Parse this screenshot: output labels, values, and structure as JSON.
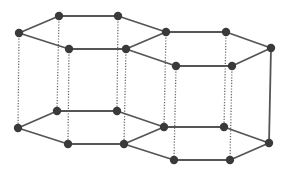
{
  "diagram": {
    "type": "crystal-lattice",
    "colors": {
      "background": "#ffffff",
      "atom": "#3a3a3a",
      "bond": "#555555",
      "vertical_dotted": "#6a6a6a"
    },
    "atom_radius": 4.2,
    "nodes": {
      "tL0": [
        19,
        33
      ],
      "tL1": [
        59,
        16
      ],
      "tL2": [
        118,
        16
      ],
      "tL3": [
        126,
        49
      ],
      "tL4": [
        69,
        49
      ],
      "tS": [
        166,
        32
      ],
      "tR1": [
        226,
        32
      ],
      "tR2": [
        271,
        48
      ],
      "tR3": [
        232,
        66
      ],
      "tR4": [
        176,
        66
      ],
      "bL0": [
        18,
        128
      ],
      "bL1": [
        57,
        111
      ],
      "bL2": [
        117,
        111
      ],
      "bL3": [
        124,
        144
      ],
      "bL4": [
        68,
        144
      ],
      "bS": [
        164,
        127
      ],
      "bR1": [
        224,
        127
      ],
      "bR2": [
        269,
        143
      ],
      "bR3": [
        230,
        160
      ],
      "bR4": [
        174,
        160
      ]
    },
    "solid_edges": [
      [
        "tL0",
        "tL1"
      ],
      [
        "tL1",
        "tL2"
      ],
      [
        "tL2",
        "tS"
      ],
      [
        "tS",
        "tL3"
      ],
      [
        "tL3",
        "tL4"
      ],
      [
        "tL4",
        "tL0"
      ],
      [
        "tS",
        "tR1"
      ],
      [
        "tR1",
        "tR2"
      ],
      [
        "tR2",
        "tR3"
      ],
      [
        "tR3",
        "tR4"
      ],
      [
        "tR4",
        "tL3"
      ],
      [
        "bL0",
        "bL1"
      ],
      [
        "bL1",
        "bL2"
      ],
      [
        "bL2",
        "bS"
      ],
      [
        "bS",
        "bL3"
      ],
      [
        "bL3",
        "bL4"
      ],
      [
        "bL4",
        "bL0"
      ],
      [
        "bS",
        "bR1"
      ],
      [
        "bR1",
        "bR2"
      ],
      [
        "bR2",
        "bR3"
      ],
      [
        "bR3",
        "bR4"
      ],
      [
        "bR4",
        "bL3"
      ],
      [
        "tR2",
        "bR2"
      ]
    ],
    "dotted_edges": [
      [
        "tL0",
        "bL0"
      ],
      [
        "tL1",
        "bL1"
      ],
      [
        "tL2",
        "bL2"
      ],
      [
        "tL3",
        "bL3"
      ],
      [
        "tL4",
        "bL4"
      ],
      [
        "tS",
        "bS"
      ],
      [
        "tR1",
        "bR1"
      ],
      [
        "tR3",
        "bR3"
      ],
      [
        "tR4",
        "bR4"
      ]
    ]
  }
}
